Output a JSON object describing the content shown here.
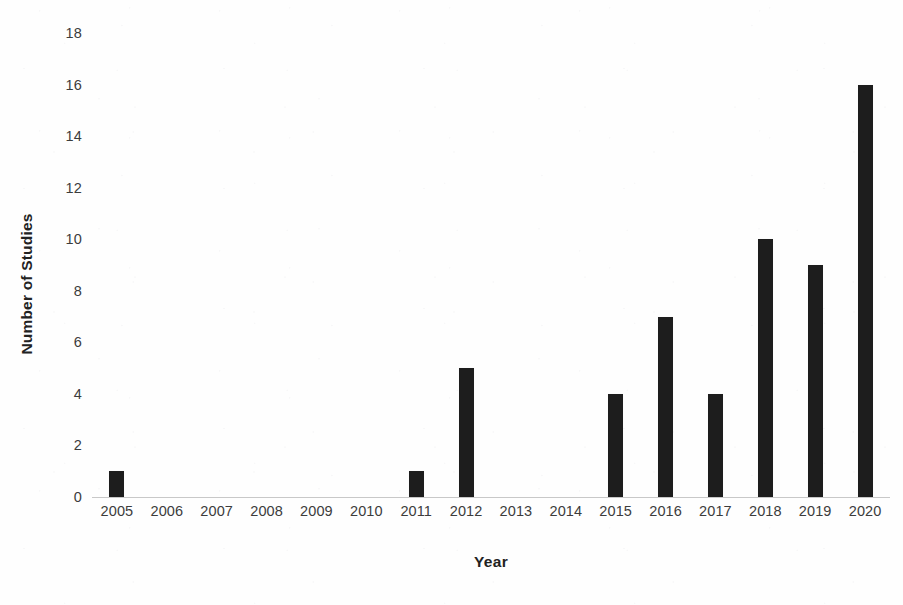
{
  "chart_data": {
    "type": "bar",
    "title": "",
    "xlabel": "Year",
    "ylabel": "Number of Studies",
    "categories": [
      "2005",
      "2006",
      "2007",
      "2008",
      "2009",
      "2010",
      "2011",
      "2012",
      "2013",
      "2014",
      "2015",
      "2016",
      "2017",
      "2018",
      "2019",
      "2020"
    ],
    "values": [
      1,
      0,
      0,
      0,
      0,
      0,
      1,
      5,
      0,
      0,
      4,
      7,
      4,
      10,
      9,
      16
    ],
    "ylim": [
      0,
      18
    ],
    "y_ticks": [
      0,
      2,
      4,
      6,
      8,
      10,
      12,
      14,
      16,
      18
    ],
    "y_tick_labels": [
      "0",
      "2",
      "4",
      "6",
      "8",
      "10",
      "12",
      "14",
      "16",
      "18"
    ],
    "grid": false,
    "legend": null,
    "series": [
      {
        "name": "Number of Studies",
        "values": [
          1,
          0,
          0,
          0,
          0,
          0,
          1,
          5,
          0,
          0,
          4,
          7,
          4,
          10,
          9,
          16
        ]
      }
    ],
    "colors": {
      "bar": "#1d1d1d",
      "axis_line": "#c8c8c8",
      "tick_label": "#3c3c3c",
      "axis_title": "#222222",
      "background": "#fefefe"
    }
  }
}
